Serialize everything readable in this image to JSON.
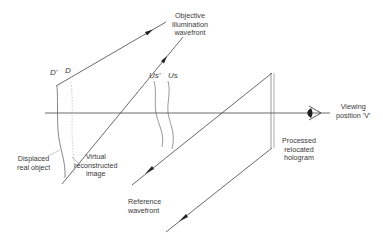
{
  "diagram": {
    "type": "holography-optical-setup",
    "labels": {
      "objective_wavefront": [
        "Objective",
        "illumination",
        "wavefront"
      ],
      "D_prime": "D'",
      "D": "D",
      "Us_prime": "Us'",
      "Us": "Us",
      "viewing_position": [
        "Viewing",
        "position 'V'"
      ],
      "displaced_object": [
        "Displaced",
        "real object"
      ],
      "virtual_image": [
        "Virtual",
        "reconstructed",
        "image"
      ],
      "hologram": [
        "Processed",
        "relocated",
        "hologram"
      ],
      "reference_wavefront": [
        "Reference",
        "wavefront"
      ]
    },
    "colors": {
      "line": "#3a3a3a",
      "faint_line": "#9a9a9a",
      "background": "#ffffff"
    }
  }
}
